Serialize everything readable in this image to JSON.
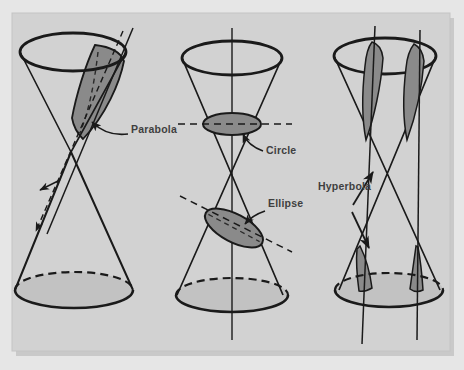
{
  "figure": {
    "panel": {
      "background_color": "#d2d2d2",
      "outer_background_color": "#e6e6e6",
      "shadow_color": "#b4b4b4"
    },
    "style": {
      "outline_color": "#1a1a1a",
      "cut_fill_color": "#8a8a8a",
      "base_fill_color": "#c2c2c2",
      "label_color": "#3f3f3f",
      "dashed_plane_color": "#2a2a2a"
    },
    "labels": [
      {
        "id": "parabola",
        "text": "Parabola",
        "x": 131,
        "y": 133,
        "anchor": "start"
      },
      {
        "id": "circle",
        "text": "Circle",
        "x": 266,
        "y": 154,
        "anchor": "start"
      },
      {
        "id": "ellipse",
        "text": "Ellipse",
        "x": 268,
        "y": 207,
        "anchor": "start"
      },
      {
        "id": "hyperbola",
        "text": "Hyperbola",
        "x": 318,
        "y": 190,
        "anchor": "start"
      }
    ],
    "cones": [
      {
        "id": "left-cone",
        "section": "Parabola",
        "cut_type": "slanted plane parallel to a side, cutting one nappe"
      },
      {
        "id": "middle-cone",
        "section": "Circle and Ellipse",
        "cut_type": "horizontal plane yields circle; oblique plane yields ellipse"
      },
      {
        "id": "right-cone",
        "section": "Hyperbola",
        "cut_type": "two vertical planes cutting both nappes"
      }
    ]
  }
}
